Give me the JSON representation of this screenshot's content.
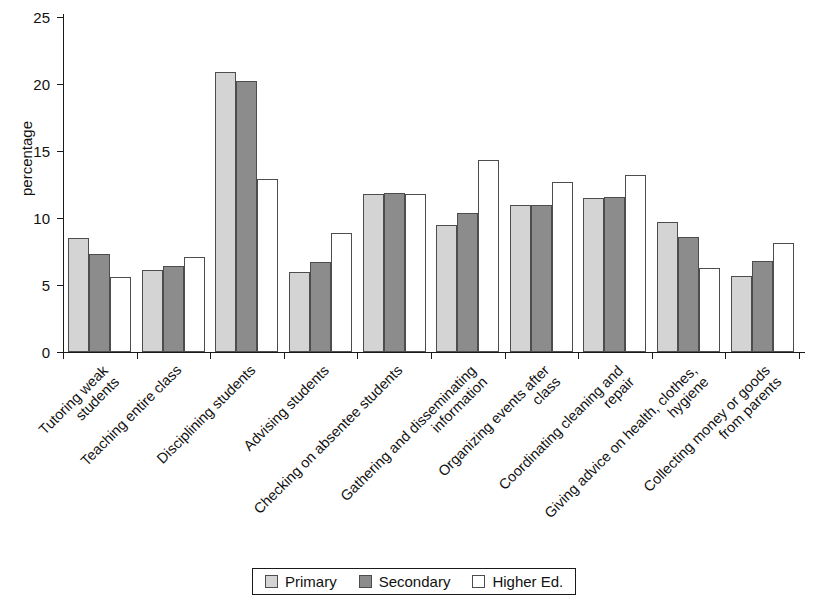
{
  "chart_data": {
    "type": "bar",
    "title": "",
    "subtitle": "",
    "xlabel": "",
    "ylabel": "percentage",
    "ylim": [
      0,
      25
    ],
    "yticks": [
      0,
      5,
      10,
      15,
      20,
      25
    ],
    "grid": false,
    "legend_position": "bottom",
    "categories": [
      "Tutoring weak\nstudents",
      "Teaching entire class",
      "Disciplining students",
      "Advising students",
      "Checking on absentee students",
      "Gathering and disseminating\ninformation",
      "Organizing events after\nclass",
      "Coordinating cleaning and\nrepair",
      "Giving advice on health, clothes,\nhygiene",
      "Collecting money or goods\nfrom parents"
    ],
    "series": [
      {
        "name": "Primary",
        "color": "#d4d4d4",
        "values": [
          8.5,
          6.1,
          20.9,
          6.0,
          11.8,
          9.5,
          11.0,
          11.5,
          9.7,
          5.7
        ]
      },
      {
        "name": "Secondary",
        "color": "#8c8c8c",
        "values": [
          7.3,
          6.4,
          20.2,
          6.7,
          11.9,
          10.4,
          11.0,
          11.6,
          8.6,
          6.8
        ]
      },
      {
        "name": "Higher Ed.",
        "color": "#ffffff",
        "values": [
          5.6,
          7.1,
          12.9,
          8.9,
          11.8,
          14.3,
          12.7,
          13.2,
          6.3,
          8.1
        ]
      }
    ]
  },
  "legend": {
    "items": [
      {
        "label": "Primary",
        "swatch": "primary"
      },
      {
        "label": "Secondary",
        "swatch": "secondary"
      },
      {
        "label": "Higher Ed.",
        "swatch": "higher"
      }
    ]
  }
}
